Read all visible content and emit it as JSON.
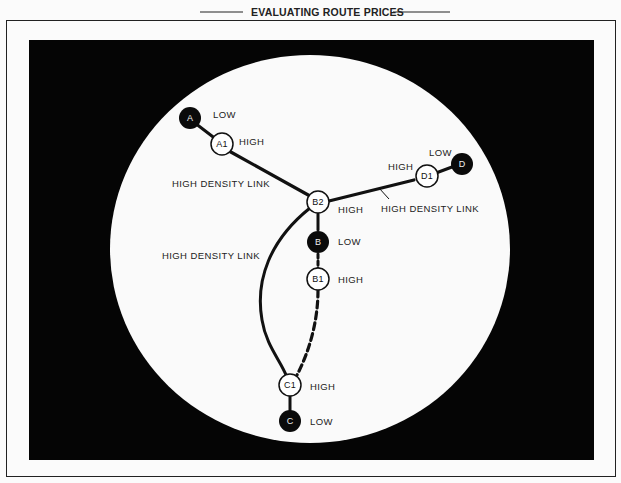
{
  "title": "EVALUATING ROUTE PRICES",
  "colors": {
    "background": "#fbfbfb",
    "panel": "#050505",
    "circle": "#fafafa",
    "ink": "#111111"
  },
  "nodes": {
    "A": {
      "label": "A",
      "price": "LOW",
      "type": "filled"
    },
    "A1": {
      "label": "A1",
      "price": "HIGH",
      "type": "open"
    },
    "B2": {
      "label": "B2",
      "price": "HIGH",
      "type": "open"
    },
    "B": {
      "label": "B",
      "price": "LOW",
      "type": "filled"
    },
    "B1": {
      "label": "B1",
      "price": "HIGH",
      "type": "open"
    },
    "C1": {
      "label": "C1",
      "price": "HIGH",
      "type": "open"
    },
    "C": {
      "label": "C",
      "price": "LOW",
      "type": "filled"
    },
    "D1": {
      "label": "D1",
      "price": "HIGH",
      "type": "open"
    },
    "D": {
      "label": "D",
      "price": "LOW",
      "type": "filled"
    }
  },
  "links": {
    "a1_b2": "HIGH DENSITY LINK",
    "b2_d1": "HIGH DENSITY LINK",
    "b2_c1": "HIGH DENSITY LINK"
  },
  "edges": [
    {
      "from": "A",
      "to": "A1",
      "style": "solid"
    },
    {
      "from": "A1",
      "to": "B2",
      "style": "solid-thick"
    },
    {
      "from": "B2",
      "to": "D1",
      "style": "solid-thick"
    },
    {
      "from": "D1",
      "to": "D",
      "style": "solid"
    },
    {
      "from": "B2",
      "to": "B",
      "style": "solid"
    },
    {
      "from": "B",
      "to": "B1",
      "style": "dashed"
    },
    {
      "from": "B1",
      "to": "C1",
      "style": "dashed"
    },
    {
      "from": "B2",
      "to": "C1",
      "style": "solid-curve"
    },
    {
      "from": "C1",
      "to": "C",
      "style": "solid"
    }
  ]
}
